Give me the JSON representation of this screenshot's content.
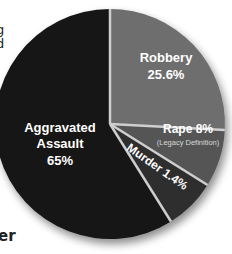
{
  "fragments": {
    "left_top_1": "g",
    "left_top_2": "d",
    "left_bottom": "er"
  },
  "chart_data": {
    "type": "pie",
    "title": "",
    "slices": [
      {
        "label": "Robbery",
        "value": 25.6,
        "display": "25.6%",
        "color": "#6e6e6e"
      },
      {
        "label": "Rape",
        "sublabel": "(Legacy Definition)",
        "value": 8,
        "display": "8%",
        "color": "#555555"
      },
      {
        "label": "Murder",
        "value": 1.4,
        "display": "1.4%",
        "color": "#2e2e2e"
      },
      {
        "label": "Aggravated Assault",
        "value": 65,
        "display": "65%",
        "color": "#141414"
      }
    ],
    "legend": "none (labels inside slices)",
    "divider_color": "#cfcfcf"
  },
  "labels": {
    "robbery_name": "Robbery",
    "robbery_value": "25.6%",
    "rape_name_value": "Rape 8%",
    "rape_sub": "(Legacy Definition)",
    "murder": "Murder 1.4%",
    "assault_line1": "Aggravated",
    "assault_line2": "Assault",
    "assault_value": "65%"
  }
}
